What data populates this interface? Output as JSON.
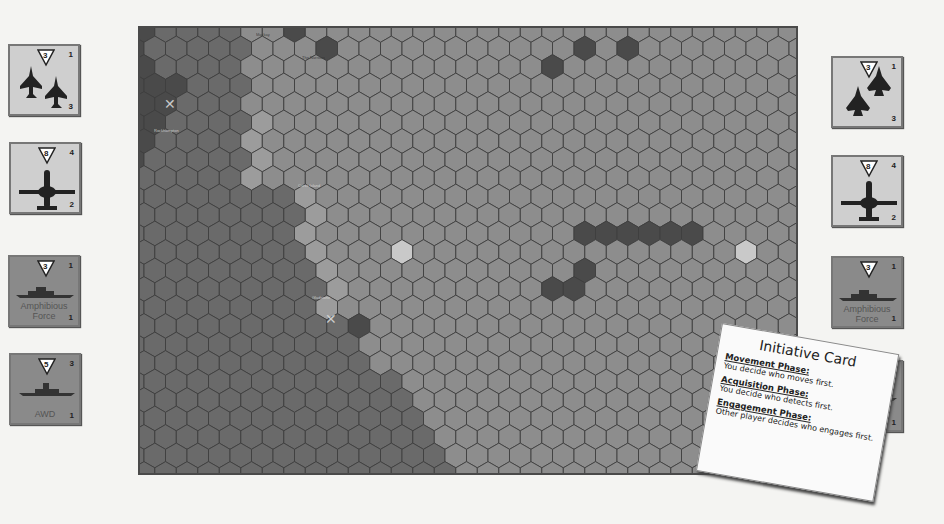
{
  "board": {
    "cols": 31,
    "rows": 25,
    "hex_width": 21.5,
    "row_height": 18.5,
    "colors": {
      "land": "#6a6a6a",
      "sea": "#8d8d8d",
      "coast": "#9c9c9c",
      "dark": "#4a4a4a",
      "highlight": "#c9c9c9",
      "grid": "#3e3e3e"
    },
    "labels": [
      {
        "text": "Mackay",
        "x": 116,
        "y": 4,
        "style": "dark"
      },
      {
        "text": "The Narrows",
        "x": 162,
        "y": 27,
        "style": "dark"
      },
      {
        "text": "Rockhampton",
        "x": 14,
        "y": 100,
        "style": "light"
      },
      {
        "text": "Curtis Island",
        "x": 158,
        "y": 155,
        "style": "light"
      },
      {
        "text": "Gladstone",
        "x": 172,
        "y": 267,
        "style": "light"
      }
    ],
    "markers": [
      {
        "name": "airbase-marker",
        "x": 24,
        "y": 68
      },
      {
        "name": "port-marker",
        "x": 185,
        "y": 283
      }
    ]
  },
  "counters_left": [
    {
      "id": "fighters",
      "type": "light",
      "range": "3",
      "top_value": "1",
      "bottom_value": "3",
      "label": "",
      "icon": "twin-fighter-jets-icon"
    },
    {
      "id": "awacs",
      "type": "light",
      "range": "8",
      "top_value": "4",
      "bottom_value": "2",
      "label": "",
      "icon": "awacs-aircraft-icon"
    },
    {
      "id": "amphib",
      "type": "dark",
      "range": "3",
      "top_value": "1",
      "bottom_value": "1",
      "label": "Amphibious Force",
      "icon": "amphibious-ship-icon"
    },
    {
      "id": "awd",
      "type": "dark",
      "range": "5",
      "top_value": "3",
      "bottom_value": "1",
      "label": "AWD",
      "icon": "destroyer-ship-icon"
    }
  ],
  "counters_right": [
    {
      "id": "fighters",
      "type": "light",
      "range": "3",
      "top_value": "1",
      "bottom_value": "3",
      "label": "",
      "icon": "twin-stealth-fighters-icon"
    },
    {
      "id": "awacs",
      "type": "light",
      "range": "8",
      "top_value": "4",
      "bottom_value": "2",
      "label": "",
      "icon": "awacs-aircraft-icon"
    },
    {
      "id": "amphib",
      "type": "dark",
      "range": "3",
      "top_value": "1",
      "bottom_value": "1",
      "label": "Amphibious Force",
      "icon": "amphibious-ship-icon"
    },
    {
      "id": "awd",
      "type": "dark",
      "range": "5",
      "top_value": "3",
      "bottom_value": "1",
      "label": "AWD",
      "icon": "destroyer-ship-icon"
    }
  ],
  "initiative_card": {
    "title": "Initiative Card",
    "phases": [
      {
        "name": "Movement Phase:",
        "text": "You decide who moves first."
      },
      {
        "name": "Acquisition Phase:",
        "text": "You decide  who detects first."
      },
      {
        "name": "Engagement Phase:",
        "text": "Other player decides who engages first."
      }
    ]
  }
}
